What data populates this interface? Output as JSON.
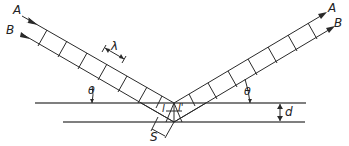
{
  "diagram": {
    "type": "bragg-reflection",
    "labels": {
      "ray_a_in": "A",
      "ray_b_in": "B",
      "ray_a_out": "A",
      "ray_b_out": "B",
      "wavelength": "λ",
      "theta_left": "θ",
      "theta_right": "θ",
      "path_left": "l",
      "path_right": "l'",
      "plane_spacing": "d",
      "beam_width": "S"
    },
    "colors": {
      "line": "#2a2a2a",
      "plane": "#555555",
      "background": "#ffffff"
    }
  }
}
